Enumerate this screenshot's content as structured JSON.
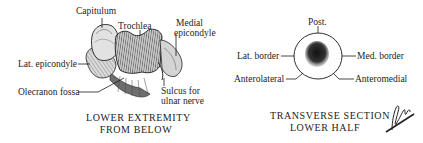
{
  "left_panel": {
    "labels": {
      "capitulum": "Capitulum",
      "trochlea": "Trochlea",
      "medial_epicondyle_1": "Medial",
      "medial_epicondyle_2": "epicondyle",
      "lat_epicondyle": "Lat. epicondyle",
      "olecranon_fossa": "Olecranon fossa",
      "sulcus_1": "Sulcus for",
      "sulcus_2": "ulnar nerve"
    },
    "caption": {
      "line1": "LOWER EXTREMITY",
      "line2": "FROM BELOW"
    }
  },
  "right_panel": {
    "labels": {
      "post": "Post.",
      "lat_border": "Lat. border",
      "med_border": "Med. border",
      "anterolateral": "Anterolateral",
      "anteromedial": "Anteromedial"
    },
    "caption": {
      "line1": "TRANSVERSE SECTION",
      "line2": "LOWER HALF"
    }
  },
  "colors": {
    "ink": "#1a1a1a",
    "bone_light": "#d9d9d9",
    "bone_mid": "#8a8a8a",
    "marrow": "#2a2a2a"
  }
}
